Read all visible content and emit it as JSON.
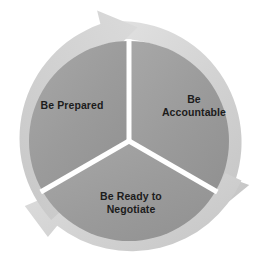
{
  "diagram": {
    "type": "three-segment-cycle",
    "title": "",
    "background_color": "#ffffff",
    "colors": {
      "segment_fill": "#9a9a9a",
      "segment_fill_light": "#a6a6a6",
      "ring_fill": "#d0d0d0",
      "ring_fill_light": "#dcdcdc",
      "ring_shadow": "#bdbdbd",
      "divider": "#ffffff",
      "label_text": "#1c1c1c"
    },
    "geometry": {
      "center_x": 129,
      "center_y": 141,
      "pie_radius": 100,
      "ring_inner_radius": 103,
      "ring_outer_radius": 121,
      "divider_angles_deg": [
        90,
        210,
        330
      ],
      "direction": "clockwise"
    },
    "segments": [
      {
        "id": "prepared",
        "label": "Be Prepared",
        "lines": [
          "Be Prepared"
        ],
        "position": "left",
        "start_angle_deg": 210,
        "end_angle_deg": 330
      },
      {
        "id": "accountable",
        "label": "Be Accountable",
        "lines": [
          "Be",
          "Accountable"
        ],
        "position": "right",
        "start_angle_deg": 330,
        "end_angle_deg": 90
      },
      {
        "id": "negotiate",
        "label": "Be Ready to Negotiate",
        "lines": [
          "Be Ready to",
          "Negotiate"
        ],
        "position": "bottom",
        "start_angle_deg": 90,
        "end_angle_deg": 210
      }
    ],
    "arrows": [
      {
        "id": "arrow-top",
        "tip_angle_deg": 96,
        "points": "clockwise"
      },
      {
        "id": "arrow-lower-right",
        "tip_angle_deg": 336,
        "points": "clockwise"
      },
      {
        "id": "arrow-lower-left",
        "tip_angle_deg": 216,
        "points": "clockwise"
      }
    ]
  },
  "labels": {
    "prepared": "Be Prepared",
    "accountable": "Be\nAccountable",
    "negotiate": "Be Ready to\nNegotiate"
  }
}
